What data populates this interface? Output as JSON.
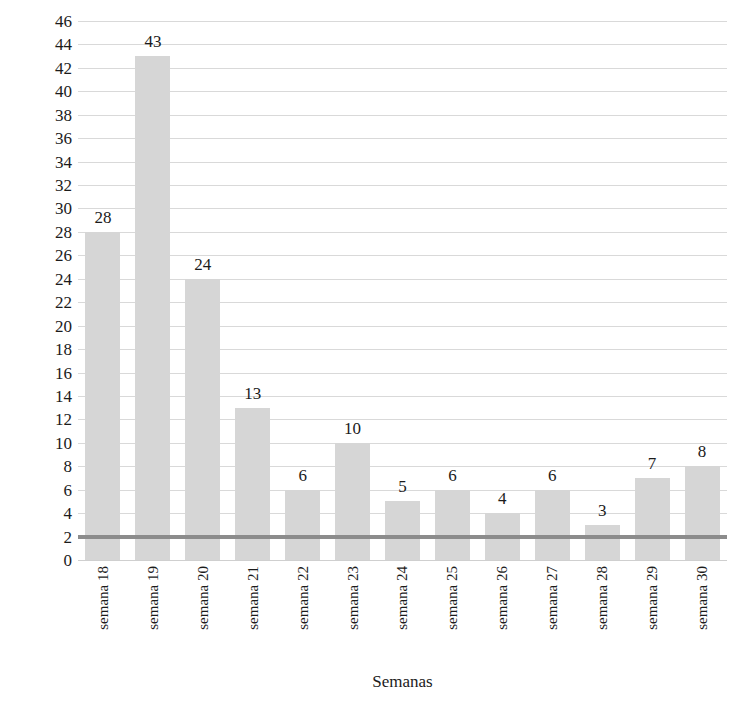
{
  "chart_data": {
    "type": "bar",
    "title": "",
    "xlabel": "Semanas",
    "ylabel": "média de dias",
    "categories": [
      "semana 18",
      "semana 19",
      "semana 20",
      "semana 21",
      "semana 22",
      "semana 23",
      "semana 24",
      "semana 25",
      "semana 26",
      "semana 27",
      "semana 28",
      "semana 29",
      "semana 30"
    ],
    "values": [
      28,
      43,
      24,
      13,
      6,
      10,
      5,
      6,
      4,
      6,
      3,
      7,
      8
    ],
    "data_labels": [
      "28",
      "43",
      "24",
      "13",
      "6",
      "10",
      "5",
      "6",
      "4",
      "6",
      "3",
      "7",
      "8"
    ],
    "ylim": [
      0,
      46
    ],
    "ytick_step": 2,
    "yticks": [
      46,
      44,
      42,
      40,
      38,
      36,
      34,
      32,
      30,
      28,
      26,
      24,
      22,
      20,
      18,
      16,
      14,
      12,
      10,
      8,
      6,
      4,
      2,
      0
    ],
    "ytick_labels": [
      "46",
      "44",
      "42",
      "40",
      "38",
      "36",
      "34",
      "32",
      "30",
      "28",
      "26",
      "24",
      "22",
      "20",
      "18",
      "16",
      "14",
      "12",
      "10",
      "8",
      "6",
      "4",
      "2",
      "0"
    ],
    "grid": true,
    "legend": false,
    "reference_line": {
      "value": 2,
      "color": "#8c8c8c",
      "label": ""
    },
    "colors": {
      "bar": "#d6d6d6",
      "grid": "#d9d9d9",
      "reference": "#8c8c8c",
      "text": "#1b1b1b",
      "background": "#ffffff"
    }
  }
}
